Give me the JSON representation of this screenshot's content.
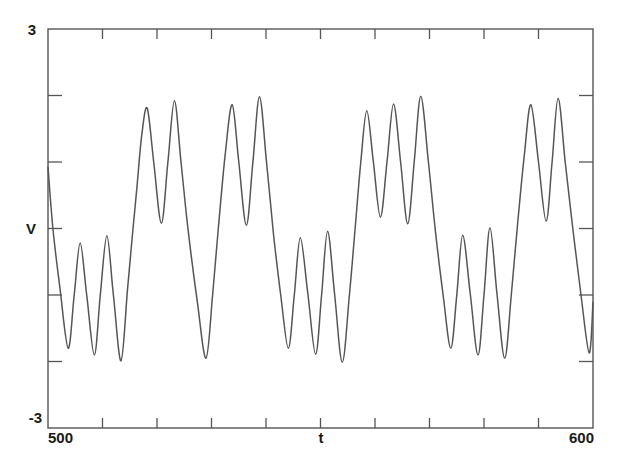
{
  "chart_data": {
    "type": "line",
    "title": "",
    "xlabel": "t",
    "ylabel": "V",
    "xlim": [
      500,
      600
    ],
    "ylim": [
      -3,
      3
    ],
    "x_tick_labels": [
      "500",
      "600"
    ],
    "y_tick_labels": [
      "3",
      "-3"
    ],
    "x_tick_step": 10,
    "y_tick_step": 1,
    "grid": false,
    "legend": null,
    "line_color": "#555555",
    "series": [
      {
        "name": "V(t)",
        "points": [
          [
            500.0,
            0.93
          ],
          [
            500.9,
            0.0
          ],
          [
            502.2,
            -0.9
          ],
          [
            503.7,
            -1.8
          ],
          [
            504.8,
            -1.0
          ],
          [
            505.9,
            -0.22
          ],
          [
            507.1,
            -1.0
          ],
          [
            508.5,
            -1.9
          ],
          [
            509.6,
            -1.0
          ],
          [
            510.8,
            -0.11
          ],
          [
            512.0,
            -1.0
          ],
          [
            513.4,
            -1.99
          ],
          [
            514.6,
            -0.9
          ],
          [
            515.6,
            0.0
          ],
          [
            516.3,
            0.6
          ],
          [
            517.2,
            1.4
          ],
          [
            518.2,
            1.81
          ],
          [
            519.4,
            1.0
          ],
          [
            520.8,
            0.08
          ],
          [
            522.0,
            1.0
          ],
          [
            523.2,
            1.92
          ],
          [
            524.4,
            1.0
          ],
          [
            525.7,
            -0.02
          ],
          [
            527.4,
            -1.1
          ],
          [
            529.0,
            -1.95
          ],
          [
            530.2,
            -1.0
          ],
          [
            531.3,
            0.05
          ],
          [
            532.5,
            1.1
          ],
          [
            533.8,
            1.86
          ],
          [
            535.0,
            1.0
          ],
          [
            536.4,
            0.05
          ],
          [
            537.6,
            1.0
          ],
          [
            538.8,
            1.98
          ],
          [
            540.1,
            1.0
          ],
          [
            541.4,
            -0.1
          ],
          [
            542.7,
            -1.0
          ],
          [
            544.1,
            -1.8
          ],
          [
            545.2,
            -1.0
          ],
          [
            546.3,
            -0.14
          ],
          [
            547.7,
            -1.0
          ],
          [
            549.1,
            -1.89
          ],
          [
            550.2,
            -1.0
          ],
          [
            551.3,
            -0.04
          ],
          [
            552.6,
            -1.0
          ],
          [
            554.0,
            -2.01
          ],
          [
            555.3,
            -1.0
          ],
          [
            556.4,
            0.05
          ],
          [
            557.4,
            1.0
          ],
          [
            558.5,
            1.77
          ],
          [
            559.7,
            1.0
          ],
          [
            561.0,
            0.17
          ],
          [
            562.2,
            1.0
          ],
          [
            563.4,
            1.87
          ],
          [
            564.7,
            1.0
          ],
          [
            566.0,
            0.07
          ],
          [
            567.2,
            1.0
          ],
          [
            568.4,
            1.99
          ],
          [
            569.8,
            1.0
          ],
          [
            571.1,
            -0.05
          ],
          [
            572.5,
            -1.0
          ],
          [
            573.9,
            -1.8
          ],
          [
            575.0,
            -1.0
          ],
          [
            576.1,
            -0.1
          ],
          [
            577.5,
            -1.0
          ],
          [
            578.9,
            -1.9
          ],
          [
            580.0,
            -1.0
          ],
          [
            581.1,
            0.01
          ],
          [
            582.4,
            -1.0
          ],
          [
            583.8,
            -1.95
          ],
          [
            585.0,
            -1.0
          ],
          [
            586.2,
            0.1
          ],
          [
            587.4,
            1.1
          ],
          [
            588.6,
            1.86
          ],
          [
            590.0,
            1.0
          ],
          [
            591.4,
            0.11
          ],
          [
            592.5,
            1.0
          ],
          [
            593.6,
            1.96
          ],
          [
            594.9,
            1.0
          ],
          [
            596.3,
            0.0
          ],
          [
            597.8,
            -1.0
          ],
          [
            599.3,
            -1.87
          ],
          [
            600.0,
            -1.1
          ]
        ]
      }
    ]
  }
}
